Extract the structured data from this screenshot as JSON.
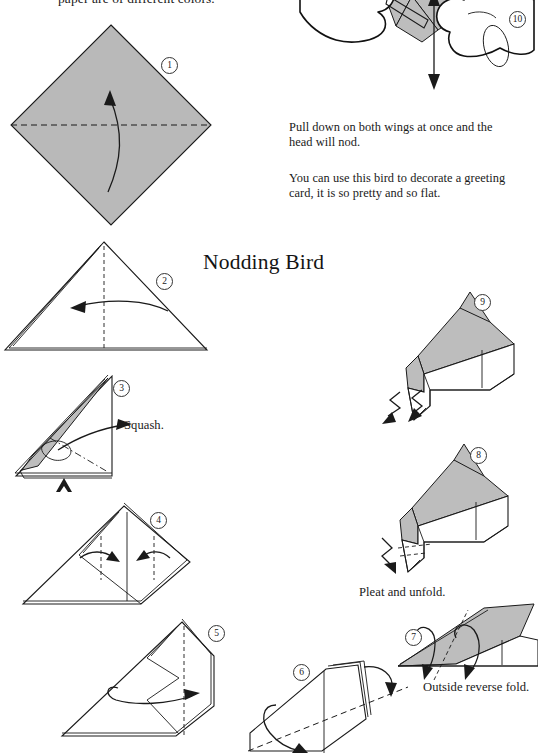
{
  "page": {
    "background": "#ffffff",
    "paper_fill": "#b9b9b9",
    "ink": "#1a1a1a",
    "title": "Nodding Bird",
    "top_cut_text": "paper are of different colors."
  },
  "captions": {
    "pull_down": "Pull down on both wings at once and the head will nod.",
    "decorate": "You can use this bird to decorate a greeting card, it is so pretty and so flat."
  },
  "fold_labels": {
    "squash": "Squash.",
    "pleat": "Pleat and unfold.",
    "outside_reverse": "Outside reverse fold."
  },
  "steps": [
    {
      "number": "1",
      "badge": "①",
      "label": "1",
      "description": "Square sheet as diamond, fold in half upward along horizontal crease"
    },
    {
      "number": "2",
      "badge": "②",
      "label": "2",
      "description": "Triangle, fold right half to the left along vertical crease"
    },
    {
      "number": "3",
      "badge": "③",
      "label": "3",
      "description": "Narrow triangle, squash fold the flap"
    },
    {
      "number": "4",
      "badge": "④",
      "label": "4",
      "description": "Fold both side corners inward to the center line"
    },
    {
      "number": "5",
      "badge": "⑤",
      "label": "5",
      "description": "Fold in half / rotate the model"
    },
    {
      "number": "6",
      "badge": "⑥",
      "label": "6",
      "description": "Fold along the diagonal crease"
    },
    {
      "number": "7",
      "badge": "⑦",
      "label": "7",
      "description": "Outside reverse fold the point"
    },
    {
      "number": "8",
      "badge": "⑧",
      "label": "8",
      "description": "Pleat and unfold the head end"
    },
    {
      "number": "9",
      "badge": "⑨",
      "label": "9",
      "description": "Finished body, shape the head"
    },
    {
      "number": "10",
      "badge": "⑩",
      "label": "10",
      "description": "Hands holding the finished bird, pull the wings"
    }
  ]
}
